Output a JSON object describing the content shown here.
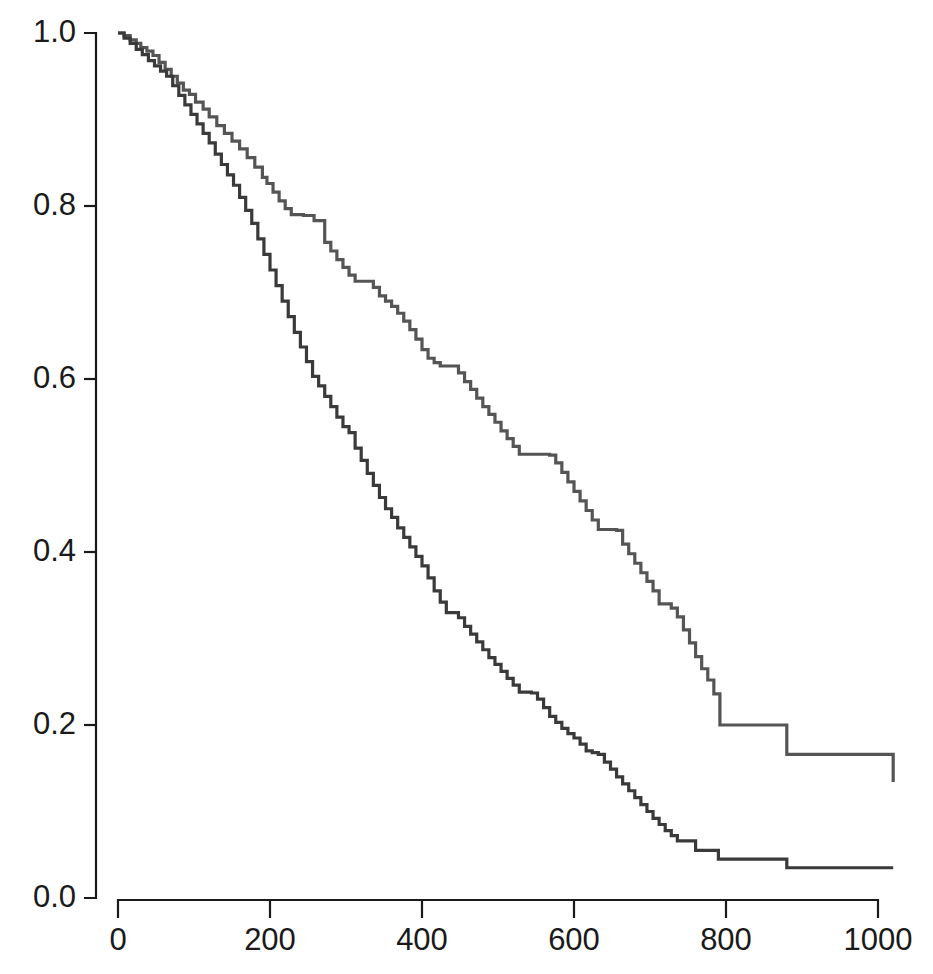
{
  "chart_data": {
    "type": "line",
    "subtype": "kaplan-meier-step",
    "title": "",
    "subtitle": "",
    "xlabel": "",
    "ylabel": "",
    "xlim": [
      0,
      1020
    ],
    "ylim": [
      0.0,
      1.0
    ],
    "grid": false,
    "legend": "none",
    "x_ticks": [
      0,
      200,
      400,
      600,
      800,
      1000
    ],
    "x_tick_labels": [
      "0",
      "200",
      "400",
      "600",
      "800",
      "1000"
    ],
    "y_ticks": [
      0.0,
      0.2,
      0.4,
      0.6,
      0.8,
      1.0
    ],
    "y_tick_labels": [
      "0.0",
      "0.2",
      "0.4",
      "0.6",
      "0.8",
      "1.0"
    ],
    "series": [
      {
        "name": "upper-curve",
        "color": "#555555",
        "final_value": 0.134,
        "x": [
          0,
          8,
          16,
          24,
          30,
          38,
          46,
          54,
          62,
          70,
          78,
          86,
          94,
          102,
          112,
          120,
          130,
          140,
          150,
          160,
          170,
          180,
          190,
          196,
          204,
          212,
          220,
          228,
          236,
          244,
          252,
          258,
          272,
          280,
          288,
          296,
          304,
          312,
          320,
          328,
          336,
          344,
          352,
          360,
          368,
          376,
          384,
          392,
          400,
          408,
          416,
          424,
          432,
          440,
          448,
          456,
          464,
          472,
          480,
          488,
          496,
          504,
          512,
          520,
          528,
          536,
          544,
          552,
          560,
          568,
          576,
          584,
          592,
          600,
          608,
          616,
          624,
          632,
          640,
          648,
          656,
          664,
          672,
          680,
          688,
          696,
          704,
          712,
          720,
          728,
          736,
          744,
          752,
          760,
          768,
          776,
          784,
          792,
          880,
          1020
        ],
        "y": [
          1.0,
          0.997,
          0.992,
          0.988,
          0.983,
          0.979,
          0.974,
          0.966,
          0.958,
          0.95,
          0.942,
          0.934,
          0.929,
          0.92,
          0.912,
          0.903,
          0.893,
          0.884,
          0.875,
          0.866,
          0.856,
          0.845,
          0.833,
          0.826,
          0.816,
          0.806,
          0.797,
          0.79,
          0.79,
          0.789,
          0.789,
          0.783,
          0.758,
          0.748,
          0.738,
          0.729,
          0.72,
          0.713,
          0.713,
          0.713,
          0.706,
          0.696,
          0.69,
          0.684,
          0.676,
          0.667,
          0.657,
          0.646,
          0.634,
          0.624,
          0.619,
          0.615,
          0.615,
          0.615,
          0.607,
          0.597,
          0.588,
          0.578,
          0.568,
          0.559,
          0.55,
          0.54,
          0.531,
          0.522,
          0.513,
          0.513,
          0.513,
          0.513,
          0.513,
          0.512,
          0.503,
          0.492,
          0.481,
          0.47,
          0.459,
          0.448,
          0.437,
          0.426,
          0.426,
          0.426,
          0.425,
          0.409,
          0.398,
          0.387,
          0.376,
          0.366,
          0.355,
          0.34,
          0.34,
          0.335,
          0.325,
          0.31,
          0.295,
          0.279,
          0.265,
          0.252,
          0.236,
          0.2,
          0.166,
          0.134
        ],
        "steps": [
          {
            "x": 0,
            "y": 1.0
          },
          {
            "x": 30,
            "y": 0.983
          },
          {
            "x": 60,
            "y": 0.96
          },
          {
            "x": 90,
            "y": 0.934
          },
          {
            "x": 120,
            "y": 0.903
          },
          {
            "x": 150,
            "y": 0.875
          },
          {
            "x": 180,
            "y": 0.845
          },
          {
            "x": 200,
            "y": 0.806
          },
          {
            "x": 225,
            "y": 0.79
          },
          {
            "x": 260,
            "y": 0.783
          },
          {
            "x": 275,
            "y": 0.752
          },
          {
            "x": 300,
            "y": 0.72
          },
          {
            "x": 330,
            "y": 0.713
          },
          {
            "x": 360,
            "y": 0.684
          },
          {
            "x": 400,
            "y": 0.634
          },
          {
            "x": 420,
            "y": 0.615
          },
          {
            "x": 450,
            "y": 0.607
          },
          {
            "x": 470,
            "y": 0.585
          },
          {
            "x": 500,
            "y": 0.56
          },
          {
            "x": 530,
            "y": 0.513
          },
          {
            "x": 570,
            "y": 0.512
          },
          {
            "x": 600,
            "y": 0.47
          },
          {
            "x": 640,
            "y": 0.426
          },
          {
            "x": 665,
            "y": 0.425
          },
          {
            "x": 680,
            "y": 0.4
          },
          {
            "x": 710,
            "y": 0.366
          },
          {
            "x": 730,
            "y": 0.34
          },
          {
            "x": 760,
            "y": 0.31
          },
          {
            "x": 790,
            "y": 0.265
          },
          {
            "x": 820,
            "y": 0.2
          },
          {
            "x": 850,
            "y": 0.166
          },
          {
            "x": 880,
            "y": 0.134
          },
          {
            "x": 1020,
            "y": 0.134
          }
        ]
      },
      {
        "name": "lower-curve",
        "color": "#3a3a3a",
        "final_value": 0.035,
        "x": [
          0,
          8,
          16,
          24,
          32,
          40,
          48,
          56,
          64,
          72,
          80,
          88,
          96,
          104,
          112,
          120,
          128,
          136,
          144,
          152,
          160,
          168,
          176,
          184,
          192,
          200,
          208,
          216,
          224,
          232,
          240,
          248,
          256,
          264,
          272,
          280,
          288,
          296,
          304,
          312,
          320,
          328,
          336,
          344,
          352,
          360,
          368,
          376,
          384,
          392,
          400,
          408,
          416,
          424,
          432,
          440,
          448,
          456,
          464,
          472,
          480,
          488,
          496,
          504,
          512,
          520,
          528,
          536,
          544,
          552,
          560,
          568,
          576,
          584,
          592,
          600,
          608,
          616,
          624,
          632,
          640,
          648,
          656,
          664,
          672,
          680,
          688,
          696,
          704,
          712,
          720,
          728,
          736,
          744,
          760,
          790,
          880,
          1020
        ],
        "y": [
          1.0,
          0.994,
          0.988,
          0.981,
          0.975,
          0.968,
          0.962,
          0.956,
          0.95,
          0.939,
          0.928,
          0.917,
          0.906,
          0.895,
          0.884,
          0.873,
          0.86,
          0.848,
          0.836,
          0.824,
          0.81,
          0.795,
          0.78,
          0.762,
          0.744,
          0.726,
          0.708,
          0.69,
          0.672,
          0.654,
          0.637,
          0.62,
          0.603,
          0.592,
          0.58,
          0.568,
          0.556,
          0.545,
          0.538,
          0.52,
          0.506,
          0.491,
          0.477,
          0.463,
          0.45,
          0.44,
          0.428,
          0.417,
          0.406,
          0.395,
          0.384,
          0.37,
          0.355,
          0.342,
          0.33,
          0.33,
          0.324,
          0.314,
          0.305,
          0.296,
          0.287,
          0.278,
          0.27,
          0.262,
          0.254,
          0.246,
          0.238,
          0.238,
          0.237,
          0.23,
          0.22,
          0.21,
          0.203,
          0.196,
          0.19,
          0.185,
          0.178,
          0.17,
          0.168,
          0.166,
          0.157,
          0.149,
          0.14,
          0.132,
          0.124,
          0.116,
          0.108,
          0.1,
          0.092,
          0.085,
          0.078,
          0.072,
          0.066,
          0.066,
          0.055,
          0.045,
          0.035,
          0.035
        ],
        "steps": [
          {
            "x": 0,
            "y": 1.0
          },
          {
            "x": 30,
            "y": 0.975
          },
          {
            "x": 60,
            "y": 0.95
          },
          {
            "x": 90,
            "y": 0.915
          },
          {
            "x": 120,
            "y": 0.873
          },
          {
            "x": 150,
            "y": 0.828
          },
          {
            "x": 175,
            "y": 0.78
          },
          {
            "x": 200,
            "y": 0.726
          },
          {
            "x": 230,
            "y": 0.66
          },
          {
            "x": 255,
            "y": 0.605
          },
          {
            "x": 280,
            "y": 0.568
          },
          {
            "x": 300,
            "y": 0.545
          },
          {
            "x": 320,
            "y": 0.506
          },
          {
            "x": 350,
            "y": 0.452
          },
          {
            "x": 380,
            "y": 0.409
          },
          {
            "x": 405,
            "y": 0.38
          },
          {
            "x": 420,
            "y": 0.352
          },
          {
            "x": 435,
            "y": 0.33
          },
          {
            "x": 460,
            "y": 0.33
          },
          {
            "x": 470,
            "y": 0.302
          },
          {
            "x": 500,
            "y": 0.27
          },
          {
            "x": 530,
            "y": 0.24
          },
          {
            "x": 555,
            "y": 0.238
          },
          {
            "x": 570,
            "y": 0.215
          },
          {
            "x": 600,
            "y": 0.19
          },
          {
            "x": 625,
            "y": 0.17
          },
          {
            "x": 645,
            "y": 0.166
          },
          {
            "x": 660,
            "y": 0.145
          },
          {
            "x": 690,
            "y": 0.112
          },
          {
            "x": 720,
            "y": 0.085
          },
          {
            "x": 745,
            "y": 0.066
          },
          {
            "x": 770,
            "y": 0.055
          },
          {
            "x": 790,
            "y": 0.045
          },
          {
            "x": 880,
            "y": 0.035
          },
          {
            "x": 1020,
            "y": 0.035
          }
        ]
      }
    ]
  },
  "axes": {
    "y_axis_name": "survival-probability-axis",
    "x_axis_name": "time-axis"
  }
}
